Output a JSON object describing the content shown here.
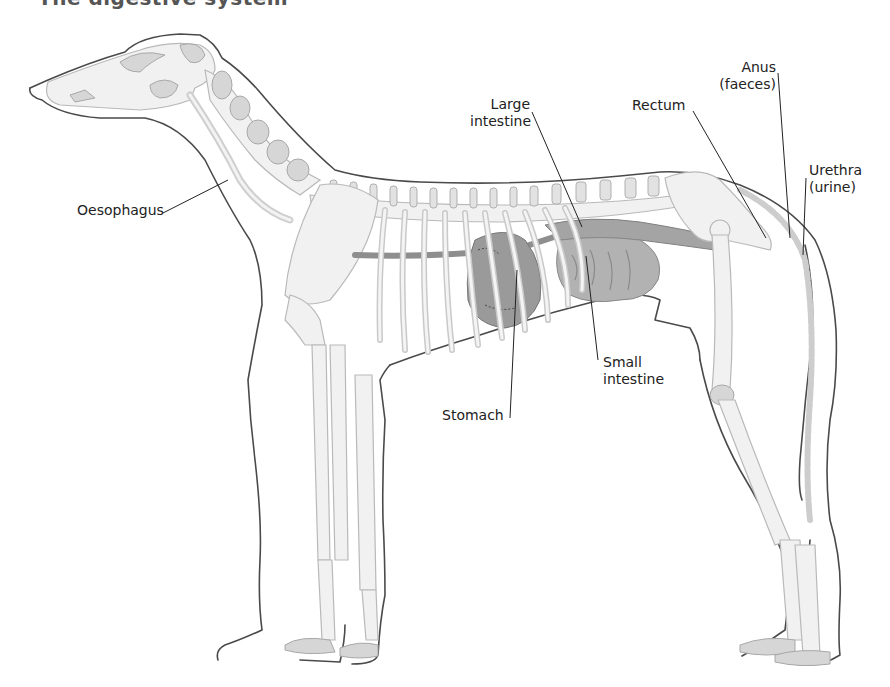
{
  "title": "The digestive system",
  "colors": {
    "outline": "#4a4a4a",
    "bone": "#f1f1f1",
    "bone_shade": "#d0d0d0",
    "organ_dark": "#8a8a8a",
    "organ_mid": "#a6a6a6",
    "label_text": "#222222"
  },
  "labels": {
    "oesophagus": "Oesophagus",
    "large_intestine_1": "Large",
    "large_intestine_2": "intestine",
    "rectum": "Rectum",
    "anus_1": "Anus",
    "anus_2": "(faeces)",
    "urethra_1": "Urethra",
    "urethra_2": "(urine)",
    "small_intestine_1": "Small",
    "small_intestine_2": "intestine",
    "stomach": "Stomach"
  }
}
